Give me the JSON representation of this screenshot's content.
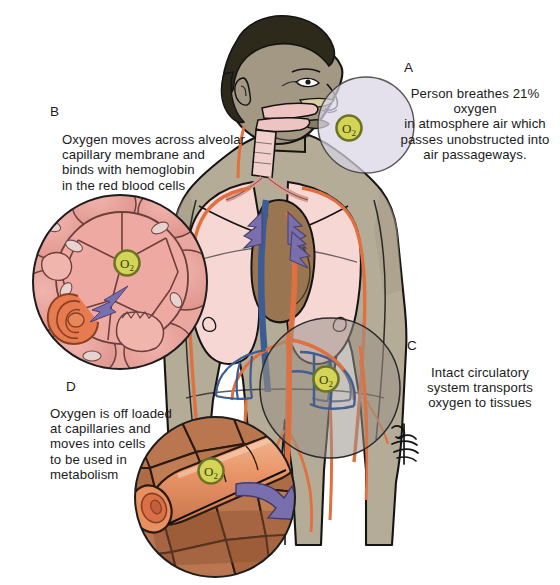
{
  "figure": {
    "background_color": "#ffffff"
  },
  "callouts": [
    {
      "letter": "A",
      "text": "Person breathes 21% oxygen\nin atmosphere air which\npasses unobstructed into\nair passageways.",
      "region": "head-and-airway",
      "circle_color": "#d9d6e4"
    },
    {
      "letter": "B",
      "text": "Oxygen moves across alveolar\ncapillary membrane  and\nbinds with hemoglobin\nin the red blood cells",
      "region": "alveoli-detail",
      "circle_color": "#e9a79f"
    },
    {
      "letter": "C",
      "text": "Intact circulatory\nsystem transports\noxygen to tissues",
      "region": "circulation-detail",
      "circle_color": "#9a9288"
    },
    {
      "letter": "D",
      "text": "Oxygen is off loaded\nat capillaries and\nmoves into cells\nto be used in\nmetabolism",
      "region": "tissue-capillary-detail",
      "circle_color": "#b5apple"
    }
  ],
  "markers": {
    "oxygen_label": "O",
    "oxygen_subscript": "2",
    "count": 4,
    "fill_color": "#d4d456",
    "ring_color": "#6d7326"
  },
  "palette": {
    "skin": "#b5ac97",
    "skin_light": "#c6bda8",
    "hair": "#2d2a1c",
    "face": "#a39883",
    "lung": "#f6d7d4",
    "heart": "#9a7551",
    "artery": "#e0703f",
    "vein": "#3c5c93",
    "arrow": "#7a6fae",
    "tissue_cell": "#b9764f",
    "capillary": "#e99a73",
    "alveoli": "#e8a49b",
    "outline": "#161616"
  },
  "signature": {
    "text": "artist signature",
    "visible": true
  }
}
